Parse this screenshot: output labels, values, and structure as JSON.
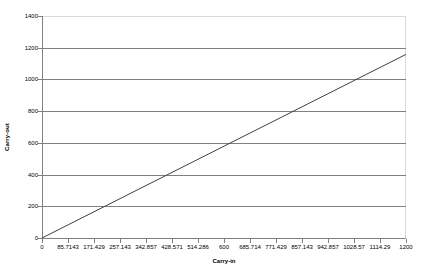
{
  "chart_data": {
    "type": "line",
    "title": "",
    "xlabel": "Carry-in",
    "ylabel": "Carry-out",
    "xlim": [
      0,
      1200
    ],
    "ylim": [
      0,
      1400
    ],
    "grid": true,
    "legend": false,
    "x_tick_labels": [
      "0",
      "85.7143",
      "171.429",
      "257.143",
      "342.857",
      "428.571",
      "514.286",
      "600",
      "685.714",
      "771.429",
      "857.143",
      "942.857",
      "1028.57",
      "1114.29",
      "1200"
    ],
    "x_tick_values": [
      0,
      85.7143,
      171.429,
      257.143,
      342.857,
      428.571,
      514.286,
      600,
      685.714,
      771.429,
      857.143,
      942.857,
      1028.57,
      1114.29,
      1200
    ],
    "y_tick_labels": [
      "0",
      "200",
      "400",
      "600",
      "800",
      "1000",
      "1200",
      "1400"
    ],
    "y_tick_values": [
      0,
      200,
      400,
      600,
      800,
      1000,
      1200,
      1400
    ],
    "series": [
      {
        "name": "Carry-out vs Carry-in",
        "color": "#404040",
        "x": [
          0,
          85.7143,
          171.429,
          257.143,
          342.857,
          428.571,
          514.286,
          600,
          685.714,
          771.429,
          857.143,
          942.857,
          1028.57,
          1114.29,
          1200
        ],
        "values": [
          0,
          82.7,
          165.4,
          248.1,
          330.9,
          413.6,
          496.3,
          579.0,
          661.7,
          744.4,
          827.1,
          909.9,
          992.6,
          1075.3,
          1158.0
        ]
      }
    ],
    "colors": {
      "line": "#404040",
      "gridline": "#808080",
      "axis": "#808080",
      "border": "#d9d9d9",
      "background": "#ffffff",
      "text": "#000000"
    }
  }
}
